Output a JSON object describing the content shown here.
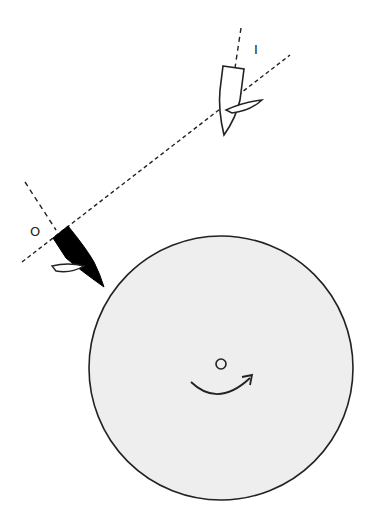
{
  "diagram": {
    "labels": {
      "inner_marker": "I",
      "outer_marker": "O"
    },
    "elements": {
      "disc": {
        "cx": 221,
        "cy": 368,
        "r": 132,
        "fill": "#eeeeee",
        "stroke": "#222222"
      },
      "center_hole": {
        "cx": 221,
        "cy": 363,
        "r": 5
      },
      "rotation_arrow": "clockwise",
      "dashed_line": {
        "x1": 22,
        "y1": 262,
        "x2": 290,
        "y2": 55
      },
      "head_outer": {
        "fill": "#000000",
        "label": "O"
      },
      "head_inner": {
        "fill": "#ffffff",
        "label": "I"
      }
    },
    "colors": {
      "background": "#ffffff",
      "disc": "#eeeeee",
      "stroke": "#222222",
      "head_outer": "#000000"
    }
  }
}
